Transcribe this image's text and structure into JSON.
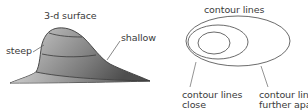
{
  "left_panel": {
    "title": "3-d surface",
    "labels": {
      "steep": "steep",
      "shallow": "shallow"
    },
    "fill_gradient": {
      "light": "#d6d6d6",
      "mid": "#9a9a9a",
      "dark": "#5a5a5a"
    },
    "outline_color": "#3d3d3d",
    "contour_bands": 3
  },
  "right_panel": {
    "title": "contour lines",
    "labels": {
      "close_line1": "contour lines",
      "close_line2": "close",
      "apart_line1": "contour lines",
      "apart_line2": "further apart"
    },
    "ellipse_count": 3,
    "stroke_color": "#555555"
  }
}
